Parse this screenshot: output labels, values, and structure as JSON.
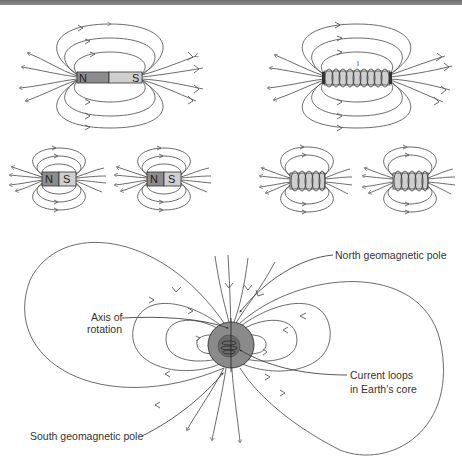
{
  "figure": {
    "top_bar_color": "#7a7a7a",
    "panels": {
      "bar_magnet_large": {
        "north_label": "N",
        "south_label": "S",
        "north_color": "#8c8c8c",
        "south_color": "#cfcfcf"
      },
      "solenoid_large": {
        "core_color": "#cfcfcf",
        "current_marker": "I"
      },
      "bar_magnets_small": [
        {
          "north_label": "N",
          "south_label": "S"
        },
        {
          "north_label": "N",
          "south_label": "S"
        }
      ],
      "solenoids_small": [
        {
          "core_color": "#cfcfcf"
        },
        {
          "core_color": "#cfcfcf"
        }
      ]
    },
    "earth": {
      "outer_color": "#8a8a8a",
      "core_color": "#6a6a6a",
      "labels": {
        "north_pole": "North geomagnetic pole",
        "axis_line1": "Axis of",
        "axis_line2": "rotation",
        "current_line1": "Current loops",
        "current_line2": "in Earth's core",
        "south_pole": "South geomagnetic pole"
      }
    }
  }
}
